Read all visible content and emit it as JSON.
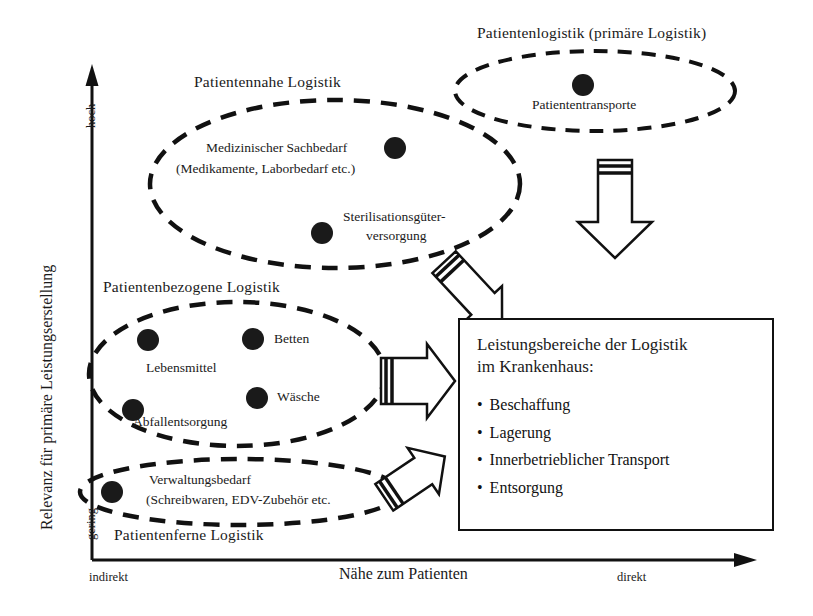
{
  "diagram": {
    "axes": {
      "y_label": "Relevanz für primäre Leistungserstellung",
      "y_high": "hoch",
      "y_low": "gering",
      "x_label": "Nähe zum Patienten",
      "x_left": "indirekt",
      "x_right": "direkt"
    },
    "groups": [
      {
        "id": "patientenlogistik",
        "title": "Patientenlogistik (primäre Logistik)",
        "items": [
          {
            "label": "Patiententransporte"
          }
        ]
      },
      {
        "id": "patientennahe",
        "title": "Patientennahe Logistik",
        "items": [
          {
            "label": "Medizinischer Sachbedarf"
          },
          {
            "label": "(Medikamente, Laborbedarf etc.)"
          },
          {
            "label": "Sterilisationsgüter-"
          },
          {
            "label": "versorgung"
          }
        ]
      },
      {
        "id": "patientenbezogene",
        "title": "Patientenbezogene Logistik",
        "items": [
          {
            "label": "Lebensmittel"
          },
          {
            "label": "Betten"
          },
          {
            "label": "Wäsche"
          },
          {
            "label": "Abfallentsorgung"
          }
        ]
      },
      {
        "id": "patientenferne",
        "title": "Patientenferne Logistik",
        "items": [
          {
            "label": "Verwaltungsbedarf"
          },
          {
            "label": "(Schreibwaren, EDV-Zubehör etc."
          }
        ]
      }
    ],
    "infobox": {
      "title_line1": "Leistungsbereiche der Logistik",
      "title_line2": "im Krankenhaus:",
      "bullets": [
        "Beschaffung",
        "Lagerung",
        "Innerbetrieblicher Transport",
        "Entsorgung"
      ],
      "bullet_glyph": "•"
    },
    "colors": {
      "ink": "#111111",
      "paper": "#ffffff",
      "dot": "#1a1a1a"
    }
  }
}
